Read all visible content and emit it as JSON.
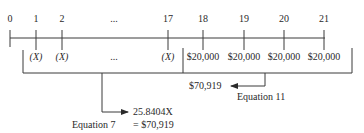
{
  "timeline": {
    "periods": [
      {
        "label": "0",
        "x": 10
      },
      {
        "label": "1",
        "x": 36
      },
      {
        "label": "2",
        "x": 62
      },
      {
        "label": "...",
        "x": 114
      },
      {
        "label": "17",
        "x": 168
      },
      {
        "label": "18",
        "x": 203
      },
      {
        "label": "19",
        "x": 244
      },
      {
        "label": "20",
        "x": 284
      },
      {
        "label": "21",
        "x": 324
      }
    ],
    "cashflows": [
      {
        "label": "(X)",
        "x": 36
      },
      {
        "label": "(X)",
        "x": 62
      },
      {
        "label": "...",
        "x": 114
      },
      {
        "label": "(X)",
        "x": 168
      },
      {
        "label": "$20,000",
        "x": 203
      },
      {
        "label": "$20,000",
        "x": 244
      },
      {
        "label": "$20,000",
        "x": 284
      },
      {
        "label": "$20,000",
        "x": 324
      }
    ]
  },
  "annotations": {
    "equation11_value": "$70,919",
    "equation11_label": "Equation 11",
    "equation7_value": "25.8404X",
    "equation7_label": "Equation 7",
    "equation7_result": "= $70,919"
  },
  "colors": {
    "line": "#3a3a3a",
    "text": "#2a2a2a"
  }
}
